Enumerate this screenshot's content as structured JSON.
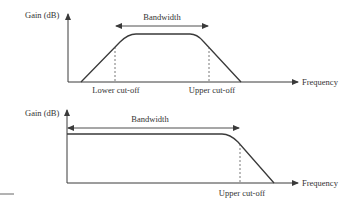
{
  "diagram": {
    "top_panel": {
      "y_axis_label": "Gain (dB)",
      "x_axis_label": "Frequency",
      "bandwidth_label": "Bandwidth",
      "lower_cutoff_label": "Lower cut-off",
      "upper_cutoff_label": "Upper cut-off",
      "response_type": "band-pass"
    },
    "bottom_panel": {
      "y_axis_label": "Gain (dB)",
      "x_axis_label": "Frequency",
      "bandwidth_label": "Bandwidth",
      "upper_cutoff_label": "Upper cut-off",
      "response_type": "low-pass"
    },
    "colors": {
      "line": "#3a3a3a",
      "text": "#333333",
      "background": "#ffffff"
    }
  }
}
